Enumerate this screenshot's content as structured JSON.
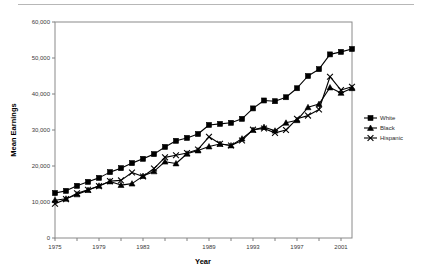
{
  "chart_data": {
    "type": "line",
    "title": "",
    "xlabel": "Year",
    "ylabel": "Mean Earnings",
    "xlim": [
      1975,
      2002
    ],
    "ylim": [
      0,
      60000
    ],
    "ytick_values": [
      0,
      10000,
      20000,
      30000,
      40000,
      50000,
      60000
    ],
    "ytick_labels": [
      "0",
      "10,000",
      "20,000",
      "30,000",
      "40,000",
      "50,000",
      "60,000"
    ],
    "xtick_values": [
      1975,
      1977,
      1979,
      1981,
      1983,
      1985,
      1987,
      1989,
      1991,
      1993,
      1995,
      1997,
      1999,
      2001
    ],
    "xtick_labels": [
      "1975",
      "",
      "1979",
      "",
      "1983",
      "",
      "",
      "1989",
      "",
      "1993",
      "",
      "1997",
      "",
      "2001"
    ],
    "x": [
      1975,
      1976,
      1977,
      1978,
      1979,
      1980,
      1981,
      1982,
      1983,
      1984,
      1985,
      1986,
      1987,
      1988,
      1989,
      1990,
      1991,
      1992,
      1993,
      1994,
      1995,
      1996,
      1997,
      1998,
      1999,
      2000,
      2001,
      2002
    ],
    "grid": false,
    "legend_position": "right",
    "series": [
      {
        "name": "White",
        "marker": "square",
        "color": "#000000",
        "values": [
          12500,
          13100,
          14500,
          15600,
          16700,
          18300,
          19400,
          20800,
          22000,
          23300,
          25300,
          27000,
          27800,
          28900,
          31400,
          31700,
          32000,
          33100,
          36000,
          38200,
          38000,
          39100,
          41600,
          45000,
          46900,
          51000,
          51700,
          52500
        ]
      },
      {
        "name": "Black",
        "marker": "triangle",
        "color": "#000000",
        "values": [
          10500,
          10900,
          12100,
          13300,
          14500,
          15700,
          14700,
          15100,
          17200,
          18500,
          21200,
          20700,
          23400,
          24300,
          25400,
          26100,
          25700,
          27600,
          30000,
          30800,
          29800,
          32000,
          32700,
          36300,
          37200,
          41800,
          40300,
          41600
        ]
      },
      {
        "name": "Hispanic",
        "marker": "x",
        "color": "#000000",
        "values": [
          9500,
          10800,
          12400,
          13400,
          14400,
          15800,
          16000,
          18200,
          17100,
          19300,
          22400,
          23000,
          23600,
          24600,
          28100,
          26200,
          25700,
          27100,
          30100,
          30400,
          29200,
          30000,
          33100,
          34000,
          35700,
          44800,
          41100,
          42000
        ]
      }
    ]
  },
  "legend": {
    "items": [
      {
        "label": "White",
        "marker": "square"
      },
      {
        "label": "Black",
        "marker": "triangle"
      },
      {
        "label": "Hispanic",
        "marker": "x"
      }
    ]
  },
  "colors": {
    "series": "#000000",
    "axis": "#808080",
    "tick_text": "#3a3a3a",
    "title_text": "#000000",
    "top_rule": "#b7b7b7"
  }
}
